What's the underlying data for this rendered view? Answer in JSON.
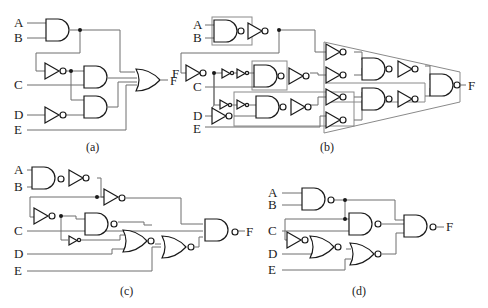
{
  "figure": {
    "panels": [
      {
        "id": "a",
        "caption": "(a)",
        "inputs": [
          "A",
          "B",
          "C",
          "D",
          "E"
        ],
        "output": "F",
        "gates": [
          "AND(A,B)",
          "NOT",
          "AND",
          "NOT(D)",
          "AND",
          "OR (5-input)"
        ]
      },
      {
        "id": "b",
        "caption": "(b)",
        "inputs": [
          "A",
          "B",
          "C",
          "D",
          "E"
        ],
        "output": "F",
        "gates": [
          "NAND+NOT (boxed)",
          "NOT",
          "buffers",
          "NAND+NOT (boxed)",
          "NAND+NOT",
          "NOT x4 array",
          "NAND+NOT x2",
          "NAND (output)"
        ]
      },
      {
        "id": "c",
        "caption": "(c)",
        "inputs": [
          "A",
          "B",
          "C",
          "D",
          "E"
        ],
        "output": "F",
        "gates": [
          "NAND",
          "NOT",
          "NOT",
          "NOT",
          "NAND",
          "small NOT",
          "NOR",
          "NOR",
          "NAND (output)"
        ]
      },
      {
        "id": "d",
        "caption": "(d)",
        "inputs": [
          "A",
          "B",
          "C",
          "D",
          "E"
        ],
        "output": "F",
        "gates": [
          "NAND(A,B)",
          "NAND",
          "NOT",
          "NOR",
          "NOR",
          "NAND (output)"
        ]
      }
    ],
    "labels": {
      "A": "A",
      "B": "B",
      "C": "C",
      "D": "D",
      "E": "E",
      "F": "F",
      "cap_a": "(a)",
      "cap_b": "(b)",
      "cap_c": "(c)",
      "cap_d": "(d)"
    }
  }
}
